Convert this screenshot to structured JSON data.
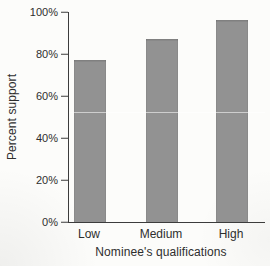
{
  "figure": {
    "background_color": "#fcfcfa",
    "text_color": "#2e2e2e"
  },
  "chart_data": {
    "type": "bar",
    "categories": [
      "Low",
      "Medium",
      "High"
    ],
    "values": [
      77,
      87,
      96
    ],
    "title": "",
    "xlabel": "Nominee's qualifications",
    "ylabel": "Percent support",
    "ylim": [
      0,
      100
    ],
    "yticks": [
      0,
      20,
      40,
      60,
      80,
      100
    ],
    "ytick_labels": [
      "0%",
      "20%",
      "40%",
      "60%",
      "80%",
      "100%"
    ],
    "grid": false,
    "legend": false,
    "bar_color": "#929292",
    "axis_color": "#3c3c3c"
  }
}
